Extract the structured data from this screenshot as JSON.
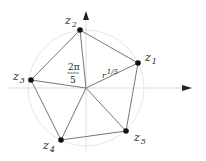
{
  "diagram": {
    "type": "roots-of-unity-pentagon",
    "center": {
      "x": 86,
      "y": 88
    },
    "circle_radius": 58,
    "axes": {
      "vertical": {
        "x": 86,
        "y_top": 12,
        "y_bottom": 152
      },
      "horizontal": {
        "y": 88,
        "x_left": 8,
        "x_right": 192
      }
    },
    "points": [
      {
        "id": "z1",
        "base": "z",
        "sub": "1",
        "x": 138,
        "y": 63,
        "label_x": 146,
        "label_y": 59
      },
      {
        "id": "z2",
        "base": "z",
        "sub": "2",
        "x": 80,
        "y": 30,
        "label_x": 66,
        "label_y": 22
      },
      {
        "id": "z3",
        "base": "z",
        "sub": "3",
        "x": 31,
        "y": 80,
        "label_x": 14,
        "label_y": 77
      },
      {
        "id": "z4",
        "base": "z",
        "sub": "4",
        "x": 61,
        "y": 140,
        "label_x": 44,
        "label_y": 150
      },
      {
        "id": "z5",
        "base": "z",
        "sub": "5",
        "x": 126,
        "y": 131,
        "label_x": 134,
        "label_y": 142
      }
    ],
    "angle_label": {
      "numerator": "2π",
      "denominator": "5",
      "x": 74,
      "y": 62
    },
    "radius_label": {
      "base": "r",
      "exponent": "1/5",
      "x": 103,
      "y": 73
    },
    "colors": {
      "line": "#777777",
      "point": "#111111",
      "axis": "#dddddd",
      "circle": "#e6e6e6",
      "arrow": "#222222"
    }
  }
}
